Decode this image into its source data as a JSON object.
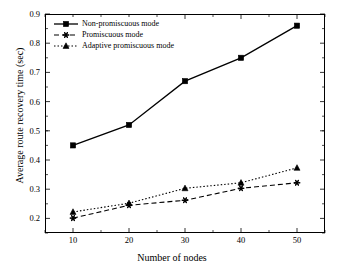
{
  "chart_data": {
    "type": "line",
    "title": "",
    "xlabel": "Number of nodes",
    "ylabel": "Average route recovery time (sec)",
    "x": [
      10,
      20,
      30,
      40,
      50
    ],
    "xlim": [
      5,
      55
    ],
    "ylim": [
      0.15,
      0.9
    ],
    "xticks": [
      "10",
      "20",
      "30",
      "40",
      "50"
    ],
    "yticks": [
      "0.9",
      "0.8",
      "0.7",
      "0.6",
      "0.5",
      "0.4",
      "0.3",
      "0.2"
    ],
    "grid": false,
    "legend_position": "top-left",
    "series": [
      {
        "name": "Non-promiscuous mode",
        "values": [
          0.45,
          0.52,
          0.67,
          0.75,
          0.86
        ],
        "marker": "square",
        "linestyle": "solid",
        "color": "#000000"
      },
      {
        "name": "Promiscuous mode",
        "values": [
          0.201,
          0.245,
          0.262,
          0.303,
          0.322
        ],
        "marker": "star",
        "linestyle": "dashed",
        "color": "#000000"
      },
      {
        "name": "Adaptive promiscuous mode",
        "values": [
          0.222,
          0.252,
          0.303,
          0.322,
          0.373
        ],
        "marker": "triangle",
        "linestyle": "dotted",
        "color": "#000000"
      }
    ]
  },
  "legend": {
    "items": [
      {
        "label": "Non-promiscuous mode"
      },
      {
        "label": "Promiscuous mode"
      },
      {
        "label": "Adaptive promiscuous mode"
      }
    ]
  },
  "axes": {
    "x_title": "Number of nodes",
    "y_title": "Average route recovery time (sec)",
    "x_ticks": [
      "10",
      "20",
      "30",
      "40",
      "50"
    ],
    "y_ticks": [
      "0.9",
      "0.8",
      "0.7",
      "0.6",
      "0.5",
      "0.4",
      "0.3",
      "0.2"
    ]
  }
}
